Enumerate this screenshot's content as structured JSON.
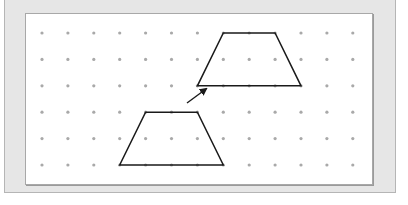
{
  "figure": {
    "type": "dot-grid translation diagram",
    "grid": {
      "columns": 13,
      "rows": 6,
      "origin_x": 42,
      "origin_y": 33,
      "spacing_x": 25.9,
      "spacing_y": 26.4,
      "dot_color": "#a9a9a9"
    },
    "shapes": [
      {
        "name": "original-trapezoid",
        "points_grid": [
          [
            4,
            3
          ],
          [
            6,
            3
          ],
          [
            7,
            5
          ],
          [
            3,
            5
          ]
        ],
        "stroke": "#1a1a1a"
      },
      {
        "name": "translated-trapezoid",
        "points_grid": [
          [
            7,
            0
          ],
          [
            9,
            0
          ],
          [
            10,
            2
          ],
          [
            6,
            2
          ]
        ],
        "stroke": "#1a1a1a"
      }
    ],
    "arrow": {
      "from": [
        187,
        103
      ],
      "to": [
        206,
        89
      ],
      "color": "#1a1a1a"
    },
    "colors": {
      "panel_outer": "#e6e6e6",
      "panel_inner": "#ffffff",
      "border": "#a8a8a8"
    }
  }
}
